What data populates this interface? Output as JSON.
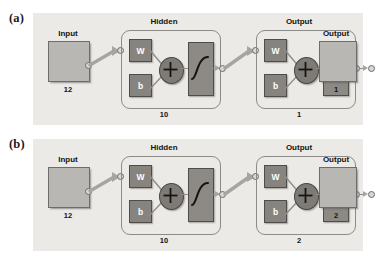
{
  "figure": {
    "type": "neural-network-architecture",
    "panel_count": 2,
    "background_color": "#eceae7",
    "page_background": "#ffffff"
  },
  "panels": [
    {
      "id": "a",
      "label": "(a)",
      "input": {
        "title": "Input",
        "size": "12"
      },
      "layers": [
        {
          "title": "Hidden",
          "size": "10",
          "weight_label": "W",
          "bias_label": "b",
          "sum_symbol": "+",
          "transfer_function": "tansig-sigmoid"
        },
        {
          "title": "Output",
          "size": "1",
          "weight_label": "W",
          "bias_label": "b",
          "sum_symbol": "+",
          "transfer_function": "tansig-sigmoid"
        }
      ],
      "output": {
        "title": "Output",
        "size": "1"
      }
    },
    {
      "id": "b",
      "label": "(b)",
      "input": {
        "title": "Input",
        "size": "12"
      },
      "layers": [
        {
          "title": "Hidden",
          "size": "10",
          "weight_label": "W",
          "bias_label": "b",
          "sum_symbol": "+",
          "transfer_function": "tansig-sigmoid"
        },
        {
          "title": "Output",
          "size": "2",
          "weight_label": "W",
          "bias_label": "b",
          "sum_symbol": "+",
          "transfer_function": "tansig-sigmoid"
        }
      ],
      "output": {
        "title": "Output",
        "size": "2"
      }
    }
  ],
  "colors": {
    "panel_bg": "#eceae7",
    "io_box_fill": "#b9b7b4",
    "param_box_fill": "#87847f",
    "transfer_box_fill": "#8d8a85",
    "sum_node_fill": "#7e7b76",
    "outline": "#6f6d6b",
    "wire": "#8f8d8a",
    "text": "#15130f"
  }
}
